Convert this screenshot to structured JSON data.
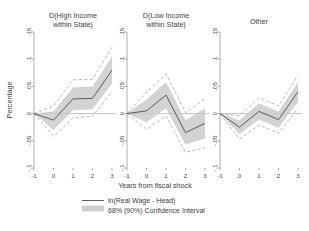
{
  "chart_data": {
    "type": "line",
    "title": "",
    "xlabel": "Years from fiscal shock",
    "ylabel": "Percentage",
    "x": [
      -1,
      0,
      1,
      2,
      3
    ],
    "xlim": [
      -1,
      3
    ],
    "ylim": [
      -0.1,
      0.15
    ],
    "xticklabels": [
      "-1",
      "0",
      "1",
      "2",
      "3"
    ],
    "yticklabels": [
      ".15",
      ".1",
      ".05",
      "0",
      "-.05",
      "-.1"
    ],
    "ytickvalues": [
      0.15,
      0.1,
      0.05,
      0,
      -0.05,
      -0.1
    ],
    "grid": false,
    "legend_position": "bottom",
    "legend": [
      {
        "label": "ln(Real Wage - Head)",
        "marker": "line"
      },
      {
        "label": "68% (90%) Confidence Interval",
        "marker": "band"
      }
    ],
    "panels": [
      {
        "title_line1": "D(High Income",
        "title_line2": "within State)",
        "series": [
          {
            "name": "ln(Real Wage - Head)",
            "values": [
              0,
              -0.012,
              0.027,
              0.028,
              0.08
            ]
          },
          {
            "name": "68% CI lower",
            "values": [
              0,
              -0.03,
              0.006,
              0.008,
              0.055
            ]
          },
          {
            "name": "68% CI upper",
            "values": [
              0,
              0.004,
              0.048,
              0.05,
              0.105
            ]
          },
          {
            "name": "90% CI lower",
            "values": [
              0,
              -0.042,
              -0.008,
              -0.005,
              0.04
            ]
          },
          {
            "name": "90% CI upper",
            "values": [
              0,
              0.014,
              0.062,
              0.063,
              0.122
            ]
          }
        ]
      },
      {
        "title_line1": "D(Low Income",
        "title_line2": "within State)",
        "series": [
          {
            "name": "ln(Real Wage - Head)",
            "values": [
              0,
              0.005,
              0.034,
              -0.035,
              -0.018
            ]
          },
          {
            "name": "68% CI lower",
            "values": [
              0,
              -0.016,
              0.01,
              -0.057,
              -0.046
            ]
          },
          {
            "name": "68% CI upper",
            "values": [
              0,
              0.026,
              0.058,
              -0.012,
              0.01
            ]
          },
          {
            "name": "90% CI lower",
            "values": [
              0,
              -0.029,
              -0.004,
              -0.071,
              -0.063
            ]
          },
          {
            "name": "90% CI upper",
            "values": [
              0,
              0.039,
              0.073,
              0.002,
              0.027
            ]
          }
        ]
      },
      {
        "title_line1": "Other",
        "title_line2": "",
        "series": [
          {
            "name": "ln(Real Wage - Head)",
            "values": [
              0,
              -0.025,
              0.004,
              -0.011,
              0.04
            ]
          },
          {
            "name": "68% CI lower",
            "values": [
              0,
              -0.038,
              -0.011,
              -0.026,
              0.022
            ]
          },
          {
            "name": "68% CI upper",
            "values": [
              0,
              -0.012,
              0.019,
              0.004,
              0.058
            ]
          },
          {
            "name": "90% CI lower",
            "values": [
              0,
              -0.047,
              -0.021,
              -0.036,
              0.01
            ]
          },
          {
            "name": "90% CI upper",
            "values": [
              0,
              -0.004,
              0.029,
              0.014,
              0.07
            ]
          }
        ]
      }
    ]
  }
}
